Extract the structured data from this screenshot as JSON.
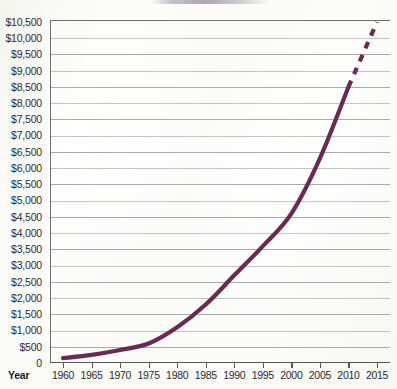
{
  "chart_data": {
    "type": "line",
    "title": "",
    "xlabel": "Year",
    "ylabel": "",
    "xlim": [
      1960,
      2015
    ],
    "ylim": [
      0,
      10500
    ],
    "grid": true,
    "legend_position": "none",
    "x_tick_labels": [
      "1960",
      "1965",
      "1970",
      "1975",
      "1980",
      "1985",
      "1990",
      "1995",
      "2000",
      "2005",
      "2010",
      "2015"
    ],
    "x_ticks": [
      1960,
      1965,
      1970,
      1975,
      1980,
      1985,
      1990,
      1995,
      2000,
      2005,
      2010,
      2015
    ],
    "y_tick_labels": [
      "$10,500",
      "$10,000",
      "$9,500",
      "$9,000",
      "$8,500",
      "$8,000",
      "$7,500",
      "$7,000",
      "$6,500",
      "$6,000",
      "$5,500",
      "$5,000",
      "$4,500",
      "$4,000",
      "$3,500",
      "$3,000",
      "$2,500",
      "$2,000",
      "$1,500",
      "$1,000",
      "$500",
      "0"
    ],
    "y_ticks": [
      10500,
      10000,
      9500,
      9000,
      8500,
      8000,
      7500,
      7000,
      6500,
      6000,
      5500,
      5000,
      4500,
      4000,
      3500,
      3000,
      2500,
      2000,
      1500,
      1000,
      500,
      0
    ],
    "series": [
      {
        "name": "Observed",
        "style": "solid",
        "color": "#6b2a52",
        "x": [
          1960,
          1965,
          1970,
          1975,
          1980,
          1985,
          1990,
          1995,
          2000,
          2005,
          2010
        ],
        "values": [
          150,
          250,
          400,
          600,
          1100,
          1800,
          2700,
          3600,
          4600,
          6300,
          8500
        ]
      },
      {
        "name": "Projected",
        "style": "dashed",
        "color": "#6b2a52",
        "x": [
          2010,
          2015
        ],
        "values": [
          8500,
          10500
        ]
      }
    ]
  },
  "axis": {
    "year_label": "Year"
  },
  "colors": {
    "series": "#6b2a52",
    "gridline": "#9a9aa4",
    "axis": "#55555a",
    "text": "#2b2b30",
    "background": "#fdfdfb"
  }
}
